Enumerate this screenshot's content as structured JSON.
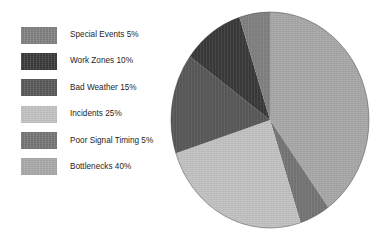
{
  "figure": {
    "background_color": "#ffffff",
    "width": 389,
    "height": 241
  },
  "legend": {
    "position": "left",
    "items": [
      {
        "label": "Special Events 5%",
        "color": "#808080",
        "swatch_name": "legend-swatch-special-events"
      },
      {
        "label": "Work Zones 10%",
        "color": "#3a3a3a",
        "swatch_name": "legend-swatch-work-zones"
      },
      {
        "label": "Bad Weather 15%",
        "color": "#585858",
        "swatch_name": "legend-swatch-bad-weather"
      },
      {
        "label": "Incidents 25%",
        "color": "#c2c2c2",
        "swatch_name": "legend-swatch-incidents"
      },
      {
        "label": "Poor Signal Timing 5%",
        "color": "#757575",
        "swatch_name": "legend-swatch-poor-signal-timing"
      },
      {
        "label": "Bottlenecks 40%",
        "color": "#a8a8a8",
        "swatch_name": "legend-swatch-bottlenecks"
      }
    ]
  },
  "chart_data": {
    "type": "pie",
    "title": "",
    "subtitle": "",
    "xlabel": "",
    "ylabel": "",
    "grid": false,
    "legend_position": "left",
    "start_angle_deg": 0,
    "direction": "clockwise",
    "center": {
      "cx": 100,
      "cy": 110
    },
    "radius": {
      "rx": 99,
      "ry": 108
    },
    "labels": [
      "Special Events",
      "Work Zones",
      "Bad Weather",
      "Incidents",
      "Poor Signal Timing",
      "Bottlenecks"
    ],
    "values": [
      5,
      10,
      15,
      25,
      5,
      40
    ],
    "unit": "%",
    "total": 100,
    "colors": [
      "#808080",
      "#3a3a3a",
      "#585858",
      "#c2c2c2",
      "#757575",
      "#a8a8a8"
    ],
    "slices_clockwise_from_top": [
      {
        "label": "Bottlenecks",
        "value": 40,
        "color": "#a8a8a8",
        "start_deg": 0,
        "end_deg": 144
      },
      {
        "label": "Poor Signal Timing",
        "value": 5,
        "color": "#757575",
        "start_deg": 144,
        "end_deg": 162
      },
      {
        "label": "Incidents",
        "value": 25,
        "color": "#c2c2c2",
        "start_deg": 162,
        "end_deg": 252
      },
      {
        "label": "Bad Weather",
        "value": 15,
        "color": "#585858",
        "start_deg": 252,
        "end_deg": 306
      },
      {
        "label": "Work Zones",
        "value": 10,
        "color": "#3a3a3a",
        "start_deg": 306,
        "end_deg": 342
      },
      {
        "label": "Special Events",
        "value": 5,
        "color": "#808080",
        "start_deg": 342,
        "end_deg": 360
      }
    ]
  }
}
